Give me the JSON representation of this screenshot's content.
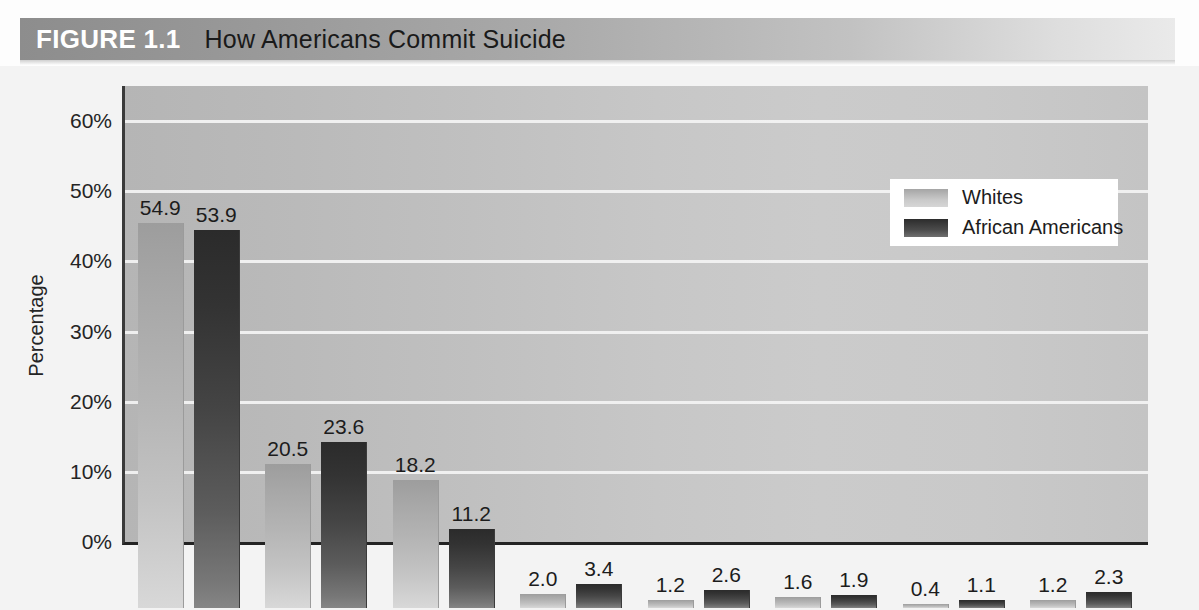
{
  "figure": {
    "label": "FIGURE 1.1",
    "title": "How Americans Commit Suicide"
  },
  "colors": {
    "banner_left": "#8d8d8d",
    "banner_right": "#eaeaea",
    "plot_background": "#c2c2c2",
    "gridline": "#f2f2f2",
    "series_whites": "#b4b4b4",
    "series_african_americans": "#454545",
    "axis": "#232323",
    "text": "#1c1c1c"
  },
  "chart_data": {
    "type": "bar",
    "title": "How Americans Commit Suicide",
    "xlabel": "",
    "ylabel": "Percentage",
    "ylim": [
      0,
      65
    ],
    "ytick_values": [
      0,
      10,
      20,
      30,
      40,
      50,
      60
    ],
    "ytick_labels": [
      "0%",
      "10%",
      "20%",
      "30%",
      "40%",
      "50%",
      "60%"
    ],
    "grid": true,
    "legend_position": "top-right",
    "categories": [
      "Guns",
      "Hanging",
      "Poison",
      "Jumping",
      "Drowning",
      "Cutting",
      "Fire",
      "Other"
    ],
    "series": [
      {
        "name": "Whites",
        "values": [
          54.9,
          20.5,
          18.2,
          2.0,
          1.2,
          1.6,
          0.4,
          1.2
        ],
        "labels": [
          "54.9",
          "20.5",
          "18.2",
          "2.0",
          "1.2",
          "1.6",
          "0.4",
          "1.2"
        ]
      },
      {
        "name": "African Americans",
        "values": [
          53.9,
          23.6,
          11.2,
          3.4,
          2.6,
          1.9,
          1.1,
          2.3
        ],
        "labels": [
          "53.9",
          "23.6",
          "11.2",
          "3.4",
          "2.6",
          "1.9",
          "1.1",
          "2.3"
        ]
      }
    ]
  }
}
